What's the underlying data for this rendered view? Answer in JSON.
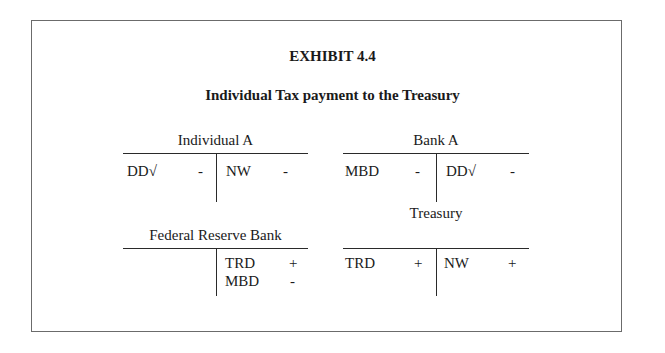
{
  "exhibit": {
    "number": "EXHIBIT 4.4",
    "subtitle": "Individual Tax payment to the Treasury"
  },
  "accounts": [
    {
      "name": "Individual A",
      "left": [
        {
          "item": "DD√",
          "sign": "-"
        }
      ],
      "right": [
        {
          "item": "NW",
          "sign": "-"
        }
      ]
    },
    {
      "name": "Bank A",
      "left": [
        {
          "item": "MBD",
          "sign": "-"
        }
      ],
      "right": [
        {
          "item": "DD√",
          "sign": "-"
        }
      ]
    },
    {
      "name": "Federal Reserve Bank",
      "left": [],
      "right": [
        {
          "item": "TRD",
          "sign": "+"
        },
        {
          "item": "MBD",
          "sign": "-"
        }
      ]
    },
    {
      "name": "Treasury",
      "left": [
        {
          "item": "TRD",
          "sign": "+"
        }
      ],
      "right": [
        {
          "item": "NW",
          "sign": "+"
        }
      ]
    }
  ]
}
